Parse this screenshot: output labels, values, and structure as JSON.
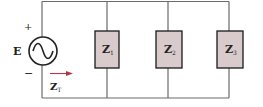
{
  "diagram": {
    "type": "parallel-ac-circuit",
    "source": {
      "label": "E",
      "plus": "+",
      "minus": "−",
      "symbol": "ac-source"
    },
    "total_impedance": {
      "label": "Z",
      "subscript": "T",
      "arrow_color": "#b03a48"
    },
    "branches": [
      {
        "label": "Z",
        "subscript": "1"
      },
      {
        "label": "Z",
        "subscript": "2"
      },
      {
        "label": "Z",
        "subscript": "3"
      }
    ],
    "colors": {
      "wire": "#6b6b6b",
      "box_fill": "#d9cbcb",
      "box_stroke": "#1a1a1a",
      "text": "#222222"
    }
  }
}
